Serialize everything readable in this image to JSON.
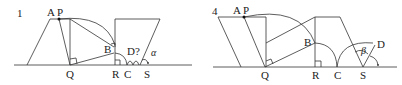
{
  "panels": [
    {
      "number": "1",
      "labels": {
        "A": "A",
        "P": "P",
        "B": "B",
        "Q": "Q",
        "R": "R",
        "C": "C",
        "S": "S",
        "D": "D?",
        "angle": "α"
      }
    },
    {
      "number": "4",
      "labels": {
        "A": "A",
        "P": "P",
        "B": "B",
        "Q": "Q",
        "R": "R",
        "C": "C",
        "S": "S",
        "D": "D",
        "angle": "β"
      }
    }
  ],
  "colors": {
    "line": "#333333",
    "text": "#222222",
    "background": "#ffffff"
  }
}
